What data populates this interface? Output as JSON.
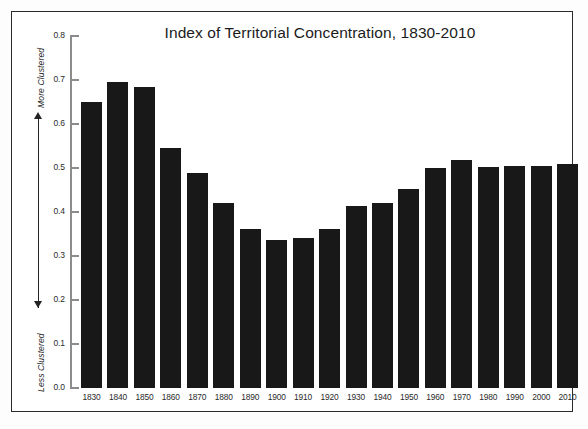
{
  "chart_data": {
    "type": "bar",
    "title": "Index of Territorial Concentration, 1830-2010",
    "xlabel": "",
    "ylabel": "",
    "ylim": [
      0.0,
      0.8
    ],
    "ytick_labels": [
      "0.0",
      "0.1",
      "0.2",
      "0.3",
      "0.4",
      "0.5",
      "0.6",
      "0.7",
      "0.8"
    ],
    "yticks": [
      0.0,
      0.1,
      0.2,
      0.3,
      0.4,
      0.5,
      0.6,
      0.7,
      0.8
    ],
    "grid": false,
    "legend": "none",
    "bar_color": "#181818",
    "axis_color": "#8c8c8c",
    "categories": [
      "1830",
      "1840",
      "1850",
      "1860",
      "1870",
      "1880",
      "1890",
      "1900",
      "1910",
      "1920",
      "1930",
      "1940",
      "1950",
      "1960",
      "1970",
      "1980",
      "1990",
      "2000",
      "2010"
    ],
    "values": [
      0.65,
      0.695,
      0.683,
      0.545,
      0.489,
      0.421,
      0.361,
      0.336,
      0.342,
      0.362,
      0.414,
      0.42,
      0.453,
      0.5,
      0.519,
      0.503,
      0.505,
      0.505,
      0.51
    ],
    "annotations": [
      {
        "name": "more-clustered",
        "text": "More Clustered",
        "position": "y-axis-top",
        "rotation": -90
      },
      {
        "name": "less-clustered",
        "text": "Less Clustered",
        "position": "y-axis-bottom",
        "rotation": -90
      },
      {
        "name": "direction-arrow",
        "text": "",
        "position": "y-axis-left",
        "style": "double-headed-vertical-arrow"
      }
    ]
  },
  "axis": {
    "more_clustered": "More Clustered",
    "less_clustered": "Less Clustered"
  }
}
